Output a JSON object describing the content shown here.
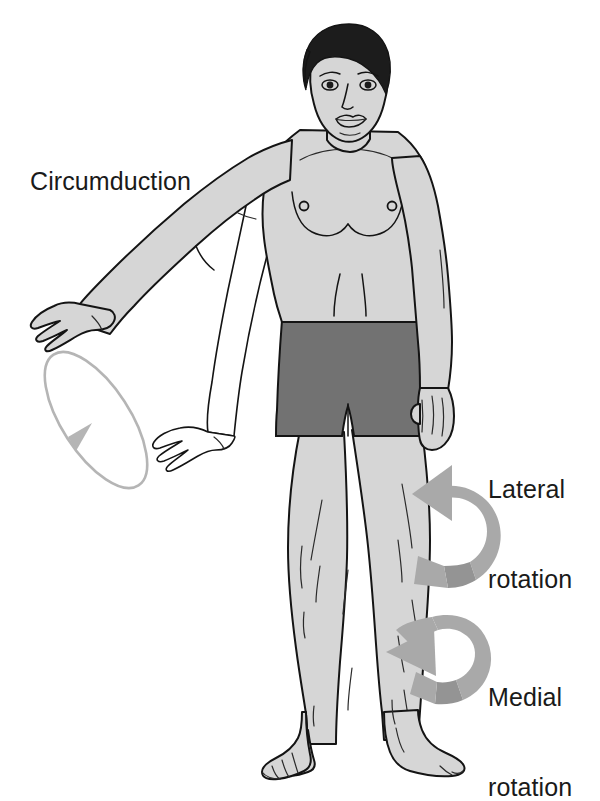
{
  "figure": {
    "background_color": "#ffffff"
  },
  "labels": {
    "circumduction": "Circumduction",
    "lateral_rotation_line1": "Lateral",
    "lateral_rotation_line2": "rotation",
    "medial_rotation_line1": "Medial",
    "medial_rotation_line2": "rotation"
  },
  "colors": {
    "skin": "#d6d6d6",
    "skin_shadow": "#c3c3c3",
    "hair": "#1c1c1c",
    "shorts": "#727272",
    "arrow_ribbon": "#a9a9a9",
    "arrow_ribbon_dark": "#949494",
    "ellipse_stroke": "#b5b5b5",
    "outline": "#141414",
    "ghost_fill": "#ffffff",
    "text": "#1a1a1a"
  },
  "annotations": {
    "circumduction_path": {
      "name": "circumduction-ellipse",
      "shape": "ellipse",
      "center_x": 96,
      "center_y": 420,
      "radius_x": 34,
      "radius_y": 78,
      "rotation_deg": -33,
      "direction": "counter-clockwise",
      "arrowhead_at": "lower-left"
    },
    "lateral_rotation_arrow": {
      "name": "lateral-rotation-arrow",
      "shape": "curved-ribbon",
      "wraps": "right-thigh",
      "arrow_points": "up-left"
    },
    "medial_rotation_arrow": {
      "name": "medial-rotation-arrow",
      "shape": "curved-ribbon",
      "wraps": "right-lower-leg",
      "arrow_points": "down-left"
    }
  },
  "body_parts": [
    "head",
    "hair",
    "face",
    "neck",
    "torso",
    "chest",
    "nipples",
    "navel",
    "shorts",
    "left-arm-abducted",
    "left-arm-ghost-hanging",
    "left-hand-abducted",
    "left-hand-ghost",
    "right-arm",
    "right-hand",
    "left-leg",
    "right-leg",
    "left-foot",
    "right-foot"
  ]
}
